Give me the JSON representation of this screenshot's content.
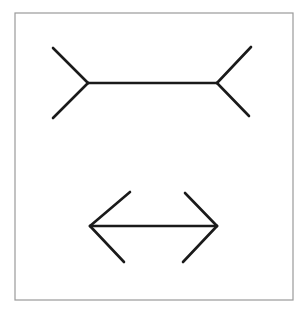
{
  "figure": {
    "name": "Muller-Lyer illusion",
    "frame": {
      "x": 15,
      "y": 13,
      "width": 278,
      "height": 287,
      "stroke": "#9a9a9a"
    },
    "line_color": "#1a1a1a",
    "top_figure": {
      "type": "fins-out",
      "shaft": [
        [
          88,
          83
        ],
        [
          217,
          83
        ]
      ],
      "fins": [
        [
          [
            53,
            48
          ],
          [
            88,
            83
          ]
        ],
        [
          [
            53,
            118
          ],
          [
            88,
            83
          ]
        ],
        [
          [
            251,
            47
          ],
          [
            217,
            83
          ]
        ],
        [
          [
            249,
            116
          ],
          [
            217,
            83
          ]
        ]
      ]
    },
    "bottom_figure": {
      "type": "fins-in",
      "shaft": [
        [
          90,
          226
        ],
        [
          217,
          226
        ]
      ],
      "fins": [
        [
          [
            130,
            192
          ],
          [
            90,
            226
          ]
        ],
        [
          [
            124,
            262
          ],
          [
            90,
            226
          ]
        ],
        [
          [
            185,
            193
          ],
          [
            217,
            226
          ]
        ],
        [
          [
            183,
            262
          ],
          [
            217,
            226
          ]
        ]
      ]
    }
  }
}
